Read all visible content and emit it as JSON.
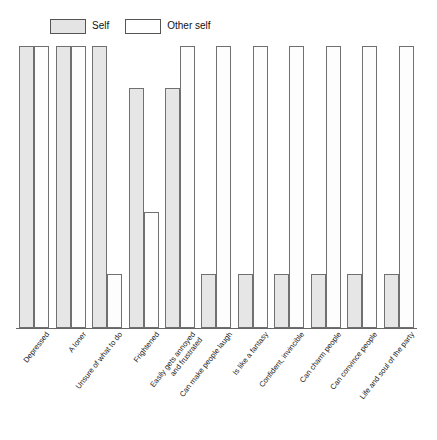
{
  "legend": {
    "items": [
      {
        "label": "Self",
        "swatch": "gray-filled-swatch",
        "color": "#e4e4e4"
      },
      {
        "label": "Other self",
        "swatch": "white-empty-swatch",
        "color": "#ffffff"
      }
    ]
  },
  "chart_data": {
    "type": "bar",
    "title": "",
    "xlabel": "",
    "ylabel": "",
    "ylim": [
      0,
      100
    ],
    "grid": false,
    "legend_position": "top-left",
    "orientation": "vertical",
    "grouping": "grouped",
    "categories": [
      "Depressed",
      "A loner",
      "Unsure of what to do",
      "Frightened",
      "Easily gets annoyed and frustrated",
      "Can make people laugh",
      "Is like a fantasy",
      "Confident, invincible",
      "Can charm people",
      "Can convince people",
      "Life and soul of the party"
    ],
    "categories_wrapped": [
      [
        "Depressed"
      ],
      [
        "A loner"
      ],
      [
        "Unsure of what to do"
      ],
      [
        "Frightened"
      ],
      [
        "Easily gets annoyed",
        "and frustrated"
      ],
      [
        "Can make people laugh"
      ],
      [
        "Is like a fantasy"
      ],
      [
        "Confident, invincible"
      ],
      [
        "Can charm people"
      ],
      [
        "Can convince people"
      ],
      [
        "Life and soul of the party"
      ]
    ],
    "series": [
      {
        "name": "Self",
        "color": "#e6e6e6",
        "values": [
          100,
          100,
          100,
          85,
          85,
          19,
          19,
          19,
          19,
          19,
          19
        ]
      },
      {
        "name": "Other self",
        "color": "#ffffff",
        "values": [
          100,
          100,
          19,
          41,
          100,
          100,
          100,
          100,
          100,
          100,
          100
        ]
      }
    ]
  }
}
